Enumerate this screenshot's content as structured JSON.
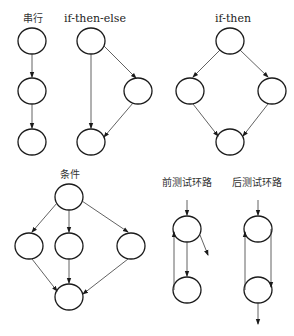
{
  "diagram": {
    "panels": [
      {
        "id": "sequential",
        "label": "串行"
      },
      {
        "id": "if-then-else",
        "label": "if-then-else"
      },
      {
        "id": "if-then",
        "label": "if-then"
      },
      {
        "id": "case",
        "label": "条件"
      },
      {
        "id": "pre-test-loop",
        "label": "前测试环路"
      },
      {
        "id": "post-test-loop",
        "label": "后测试环路"
      }
    ],
    "colors": {
      "stroke": "#1a1a1a",
      "background": "#ffffff"
    }
  }
}
